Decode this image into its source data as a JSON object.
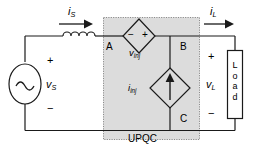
{
  "diagram": {
    "block": {
      "name": "UPQC",
      "label": "UPQC",
      "fill_color": "#dcdcdc",
      "border_color": "#7f7f7f"
    },
    "nodes": [
      {
        "id": "A",
        "label": "A"
      },
      {
        "id": "B",
        "label": "B"
      },
      {
        "id": "C",
        "label": "C"
      }
    ],
    "sources": {
      "supply": {
        "name": "ac-voltage-source",
        "symbol": "~",
        "label": "v",
        "subscript": "S",
        "plus": "+",
        "minus": "−"
      },
      "series_injected": {
        "name": "injected-voltage-source",
        "label": "v",
        "subscript": "inj",
        "plus": "+",
        "minus": "−"
      },
      "shunt_injected": {
        "name": "injected-current-source",
        "label": "i",
        "subscript": "inj",
        "arrow_direction": "up"
      }
    },
    "currents": [
      {
        "name": "source-current",
        "label": "i",
        "subscript": "S",
        "arrow_direction": "right"
      },
      {
        "name": "load-current",
        "label": "i",
        "subscript": "L",
        "arrow_direction": "right"
      }
    ],
    "voltages": [
      {
        "name": "load-voltage",
        "label": "v",
        "subscript": "L",
        "plus": "+",
        "minus": "−"
      }
    ],
    "components": [
      {
        "name": "series-inductor",
        "type": "inductor",
        "label": ""
      },
      {
        "name": "load-block",
        "type": "load",
        "label": "Load",
        "letters": [
          "L",
          "o",
          "a",
          "d"
        ]
      }
    ],
    "colors": {
      "wire": "#1a1a1a",
      "text": "#000000",
      "block_fill": "#dcdcdc",
      "block_border": "#808080",
      "background": "#ffffff"
    }
  }
}
